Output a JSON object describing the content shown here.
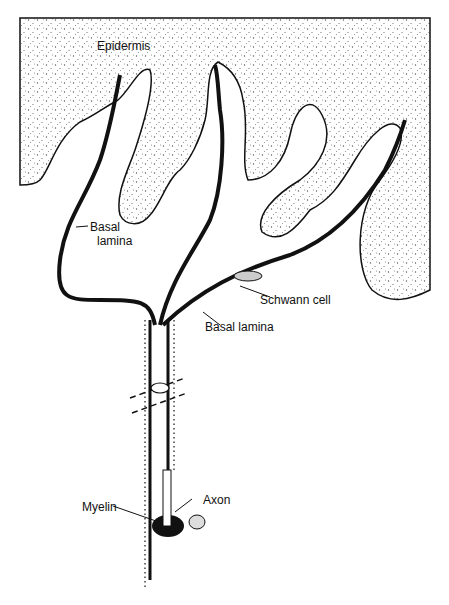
{
  "diagram": {
    "type": "anatomical illustration",
    "labels": {
      "epidermis": "Epidermis",
      "basal_lamina_1_line1": "Basal",
      "basal_lamina_1_line2": "lamina",
      "schwann_cell": "Schwann cell",
      "basal_lamina_2": "Basal lamina",
      "myelin": "Myelin",
      "axon": "Axon"
    },
    "colors": {
      "ink": "#111111",
      "stipple": "#555555",
      "background": "#ffffff"
    }
  }
}
